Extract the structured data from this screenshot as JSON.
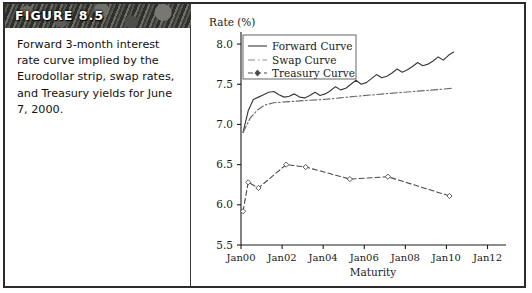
{
  "figure": {
    "banner_label": "FIGURE 8.5",
    "caption": "Forward 3-month interest rate curve implied by the Eurodollar strip, swap rates, and Treasury yields for June 7, 2000."
  },
  "colors": {
    "banner_dark": "#3d3d39",
    "banner_text": "#ffffff",
    "frame": "#2b2b2b",
    "ink": "#1a1a1a",
    "forward": "#3a3a3a",
    "swap": "#6b6b6b",
    "treasury": "#4a4a4a"
  },
  "chart_data": {
    "type": "line",
    "title": "",
    "ylabel": "Rate (%)",
    "xlabel": "Maturity",
    "grid": false,
    "legend_position": "upper-left",
    "xlim": [
      2000.0,
      2012.9
    ],
    "ylim": [
      5.5,
      8.15
    ],
    "yticks": [
      "5.5",
      "6.0",
      "6.5",
      "7.0",
      "7.5",
      "8.0"
    ],
    "ytick_values": [
      5.5,
      6.0,
      6.5,
      7.0,
      7.5,
      8.0
    ],
    "xticks": [
      "Jan00",
      "Jan02",
      "Jan04",
      "Jan06",
      "Jan08",
      "Jan10",
      "Jan12"
    ],
    "xtick_values": [
      2000,
      2002,
      2004,
      2006,
      2008,
      2010,
      2012
    ],
    "series": [
      {
        "name": "Forward Curve",
        "style": "solid",
        "marker": "none",
        "x": [
          2000.1,
          2000.35,
          2000.6,
          2000.85,
          2001.1,
          2001.35,
          2001.6,
          2001.85,
          2002.1,
          2002.35,
          2002.6,
          2002.85,
          2003.1,
          2003.35,
          2003.6,
          2003.85,
          2004.1,
          2004.35,
          2004.6,
          2004.85,
          2005.1,
          2005.35,
          2005.6,
          2005.85,
          2006.1,
          2006.35,
          2006.6,
          2006.85,
          2007.1,
          2007.35,
          2007.6,
          2007.85,
          2008.1,
          2008.35,
          2008.6,
          2008.85,
          2009.1,
          2009.35,
          2009.6,
          2009.85,
          2010.1,
          2010.35
        ],
        "values": [
          6.9,
          7.17,
          7.31,
          7.34,
          7.37,
          7.4,
          7.41,
          7.37,
          7.34,
          7.35,
          7.38,
          7.34,
          7.33,
          7.36,
          7.4,
          7.36,
          7.38,
          7.42,
          7.47,
          7.43,
          7.45,
          7.5,
          7.55,
          7.5,
          7.52,
          7.57,
          7.62,
          7.58,
          7.6,
          7.64,
          7.69,
          7.65,
          7.68,
          7.72,
          7.77,
          7.73,
          7.75,
          7.79,
          7.84,
          7.8,
          7.86,
          7.9
        ]
      },
      {
        "name": "Swap Curve",
        "style": "dash-dot",
        "marker": "none",
        "x": [
          2000.1,
          2000.45,
          2000.8,
          2001.15,
          2001.6,
          2002.1,
          2002.7,
          2003.3,
          2004.0,
          2004.8,
          2005.6,
          2006.5,
          2007.4,
          2008.4,
          2009.4,
          2010.3
        ],
        "values": [
          6.9,
          7.08,
          7.18,
          7.24,
          7.27,
          7.28,
          7.29,
          7.3,
          7.31,
          7.33,
          7.35,
          7.37,
          7.39,
          7.41,
          7.43,
          7.45
        ]
      },
      {
        "name": "Treasury Curve",
        "style": "dashed",
        "marker": "diamond",
        "x": [
          2000.1,
          2000.35,
          2000.85,
          2002.2,
          2003.15,
          2005.3,
          2007.15,
          2010.15
        ],
        "values": [
          5.92,
          6.28,
          6.21,
          6.5,
          6.47,
          6.32,
          6.35,
          6.11
        ]
      }
    ]
  }
}
